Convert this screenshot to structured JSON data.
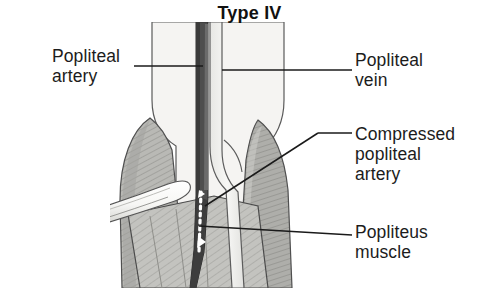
{
  "figure": {
    "title": "Type IV",
    "kind": "medical-illustration",
    "style": "grayscale line drawing with hatching"
  },
  "labels": {
    "popliteal_artery": "Popliteal\nartery",
    "popliteal_vein": "Popliteal\nvein",
    "compressed_popliteal_artery": "Compressed\npopliteal\nartery",
    "popliteus_muscle": "Popliteus\nmuscle"
  },
  "colors": {
    "background": "#ffffff",
    "ink": "#1a1a1a",
    "outline": "#4a4a4a",
    "artery_dark": "#4e4e4e",
    "artery_darkest": "#3a3a3a",
    "vein_light": "#f2f2f0",
    "bone_light": "#f4f3f1",
    "muscle_mid": "#b8b8b4",
    "muscle_shade": "#9d9d99",
    "muscle_light": "#cfcfcb",
    "probe_light": "#ededea",
    "dotted_line": "#ffffff"
  },
  "anatomy": {
    "structures": [
      "popliteal artery",
      "popliteal vein",
      "medial head of gastrocnemius",
      "lateral head of gastrocnemius",
      "popliteus muscle",
      "surgical probe"
    ],
    "compressed_segment_marker": "white dotted vertical line"
  },
  "leaders": {
    "popliteal_artery": "horizontal line from label to artery at upper left",
    "popliteal_vein": "horizontal line from vein to label at upper right",
    "compressed_popliteal_artery": "diagonal line from dotted segment up-right to label",
    "popliteus_muscle": "near-horizontal line from muscle to label at lower right"
  }
}
